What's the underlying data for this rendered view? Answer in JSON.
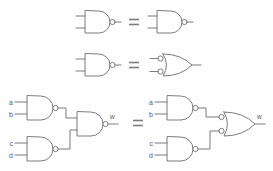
{
  "figure": {
    "background_color": "#fefefe",
    "line_color": "#7d7d7d",
    "label_color": "#5a5a5a"
  },
  "relations": {
    "equals_symbol": "=",
    "row1_equals": "=",
    "row2_equals": "=",
    "row3_equals": "="
  },
  "rows": [
    {
      "id": "row-1",
      "left": {
        "gate": "NAND",
        "inputs": 2,
        "inverted_inputs": false,
        "inverted_output": true
      },
      "right": {
        "gate": "NAND",
        "inputs": 2,
        "inverted_inputs": false,
        "inverted_output": true
      }
    },
    {
      "id": "row-2",
      "left": {
        "gate": "NAND",
        "inputs": 2,
        "inverted_inputs": false,
        "inverted_output": true
      },
      "right": {
        "gate": "OR",
        "inputs": 2,
        "inverted_inputs": true,
        "inverted_output": false
      }
    },
    {
      "id": "row-3",
      "left": {
        "circuit": "three-NAND",
        "gates": [
          {
            "name": "nand-ab",
            "gate": "NAND",
            "inputs": [
              "a",
              "b"
            ]
          },
          {
            "name": "nand-cd",
            "gate": "NAND",
            "inputs": [
              "c",
              "d"
            ]
          },
          {
            "name": "nand-out",
            "gate": "NAND",
            "inputs": [
              "nand-ab",
              "nand-cd"
            ]
          }
        ],
        "output": "w"
      },
      "right": {
        "circuit": "two-NAND-plus-bubbled-OR",
        "gates": [
          {
            "name": "nand-ab",
            "gate": "NAND",
            "inputs": [
              "a",
              "b"
            ]
          },
          {
            "name": "nand-cd",
            "gate": "NAND",
            "inputs": [
              "c",
              "d"
            ]
          },
          {
            "name": "or-out",
            "gate": "OR",
            "inverted_inputs": true,
            "inputs": [
              "nand-ab",
              "nand-cd"
            ]
          }
        ],
        "output": "w"
      }
    }
  ],
  "labels": {
    "a_left": "a",
    "b_left": "b",
    "c_left": "c",
    "d_left": "d",
    "w_left": "w",
    "a_right": "a",
    "b_right": "b",
    "c_right": "c",
    "d_right": "d",
    "w_right": "w"
  }
}
